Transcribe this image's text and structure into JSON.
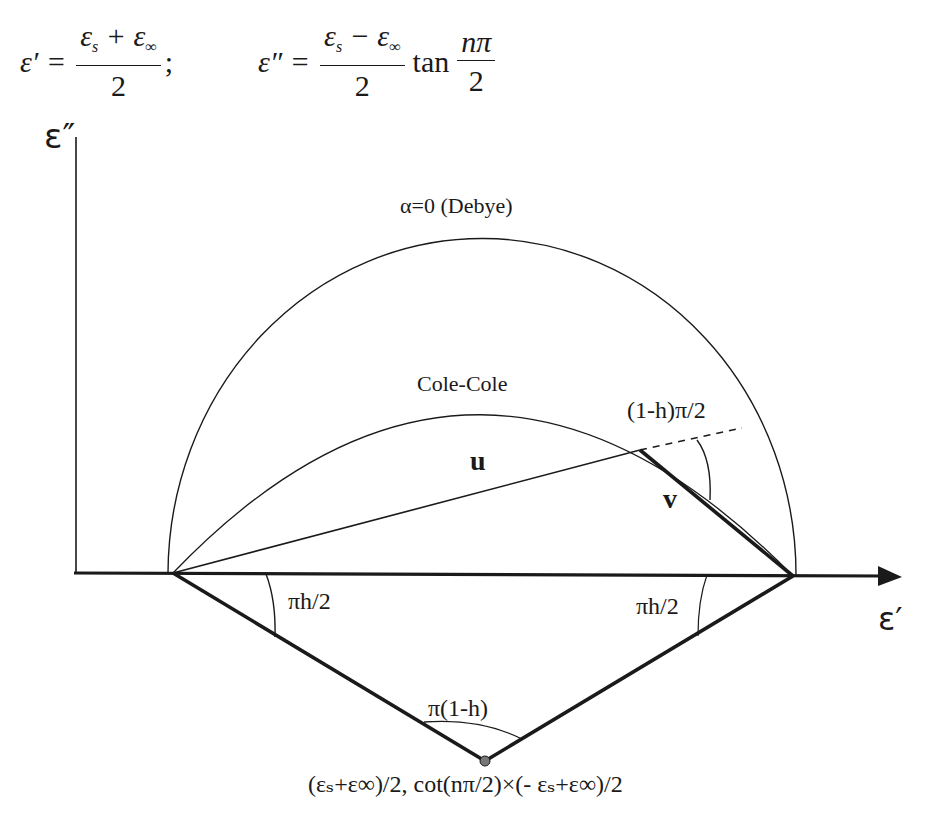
{
  "equations": {
    "eps_prime": {
      "lhs": "ε′ =",
      "numerator_a": "ε",
      "numerator_a_sub": "s",
      "numerator_op": " + ε",
      "numerator_b_sub": "∞",
      "denominator": "2",
      "trailing": ";"
    },
    "eps_double_prime": {
      "lhs": "ε″ =",
      "numerator_a": "ε",
      "numerator_a_sub": "s",
      "numerator_op": " − ε",
      "numerator_b_sub": "∞",
      "denominator": "2",
      "function": "tan",
      "arg_numerator": "nπ",
      "arg_denominator": "2"
    }
  },
  "axes": {
    "y_label": "ε″",
    "x_label": "ε′"
  },
  "labels": {
    "debye": "α=0 (Debye)",
    "cole_cole": "Cole-Cole",
    "vector_u": "u",
    "vector_v": "v",
    "angle_top": "(1-h)π/2",
    "angle_left": "πh/2",
    "angle_right": "πh/2",
    "angle_bottom": "π(1-h)",
    "center_point": "(εₛ+ε∞)/2, cot(nπ/2)×(- εₛ+ε∞)/2"
  },
  "colors": {
    "ink": "#1a1a1a",
    "background": "#ffffff",
    "center_dot": "#777777"
  }
}
